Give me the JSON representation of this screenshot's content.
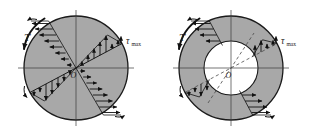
{
  "figure": {
    "background_color": "#ffffff",
    "shaft_fill_color": "#a8a8a8",
    "hole_fill_color": "#ffffff",
    "outline_color": "#1a1a1a",
    "axis_color": "#3a3a3a",
    "dashed_color": "#4a4a4a",
    "arrow_color": "#111111"
  },
  "panels": [
    {
      "id": "solid-shaft",
      "name": "Solid circular shaft",
      "center": {
        "x": 76,
        "y": 68,
        "label": "O"
      },
      "outer_radius": 52,
      "inner_radius": 0,
      "torque_label": "T",
      "tau_label": "τ",
      "tau_subscript": "max",
      "diagonal_angle_deg": 28,
      "stress_profile": {
        "type": "linear",
        "at_center": 0,
        "at_outer_radius": 1.0,
        "description": "Shear stress varies linearly from zero at the axis to tau-max at the outer surface"
      },
      "arrow_counts": {
        "upper_left": 9,
        "upper_right": 8,
        "lower_left": 8,
        "lower_right": 9
      }
    },
    {
      "id": "hollow-shaft",
      "name": "Hollow circular shaft",
      "center": {
        "x": 231,
        "y": 68,
        "label": "O"
      },
      "outer_radius": 52,
      "inner_radius": 27,
      "torque_label": "T",
      "tau_label": "τ",
      "tau_subscript": "max",
      "diagonal_angle_deg": 28,
      "stress_profile": {
        "type": "linear-truncated",
        "at_inner_radius": 0.52,
        "at_outer_radius": 1.0,
        "description": "Shear stress varies linearly from a nonzero value at the inner bore to tau-max at the outer surface"
      },
      "arrow_counts": {
        "upper_left": 5,
        "upper_right": 5,
        "lower_left": 5,
        "lower_right": 5
      }
    }
  ]
}
